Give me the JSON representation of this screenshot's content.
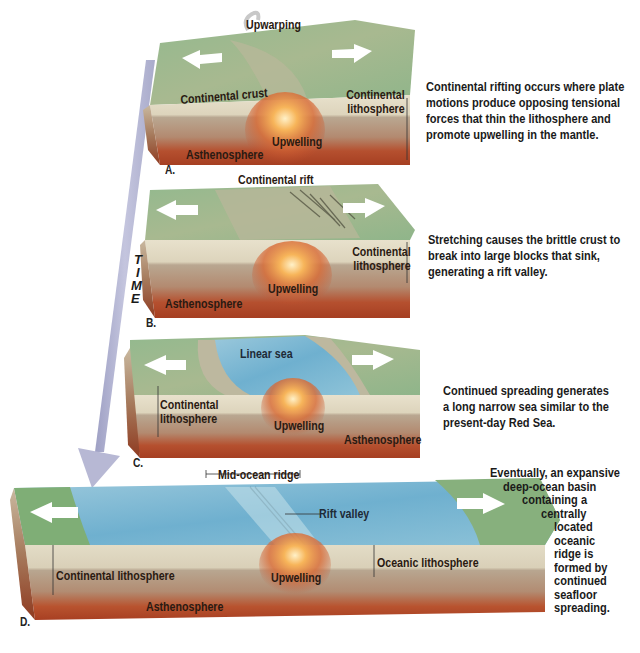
{
  "figure": {
    "time_axis": {
      "label_letters": [
        "T",
        "I",
        "M",
        "E"
      ],
      "arrow_color": "#b7b8d4"
    },
    "colors": {
      "land_green": "#8fb58a",
      "crust_cream": "#e6dfc9",
      "lithosphere_tan": "#b7a590",
      "asthenosphere_red": "#b2452a",
      "upwelling_orange": "#f0a050",
      "sea_blue": "#7ab8d4",
      "arrow_white": "#ffffff"
    },
    "panels": [
      {
        "letter": "A.",
        "labels": {
          "top": "Upwarping",
          "crust": "Continental crust",
          "lithosphere": "Continental lithosphere",
          "upwelling": "Upwelling",
          "asthenosphere": "Asthenosphere"
        },
        "caption": "Continental rifting occurs where plate motions produce opposing tensional forces that thin the lithosphere and promote upwelling in the mantle."
      },
      {
        "letter": "B.",
        "labels": {
          "top": "Continental rift",
          "lithosphere": "Continental lithosphere",
          "upwelling": "Upwelling",
          "asthenosphere": "Asthenosphere"
        },
        "caption": "Stretching causes the brittle crust to break into large blocks that sink, generating a rift valley."
      },
      {
        "letter": "C.",
        "labels": {
          "sea": "Linear sea",
          "lithosphere": "Continental lithosphere",
          "upwelling": "Upwelling",
          "asthenosphere": "Asthenosphere"
        },
        "caption": "Continued spreading generates a long narrow sea similar to the present-day Red Sea."
      },
      {
        "letter": "D.",
        "labels": {
          "ridge": "Mid-ocean ridge",
          "rift_valley": "Rift valley",
          "continental_lithosphere": "Continental lithosphere",
          "upwelling": "Upwelling",
          "oceanic_lithosphere": "Oceanic lithosphere",
          "asthenosphere": "Asthenosphere"
        },
        "caption_lines": [
          "Eventually, an expansive",
          "deep-ocean basin",
          "containing a",
          "centrally",
          "located",
          "oceanic",
          "ridge is",
          "formed by",
          "continued",
          "seafloor",
          "spreading."
        ]
      }
    ]
  }
}
